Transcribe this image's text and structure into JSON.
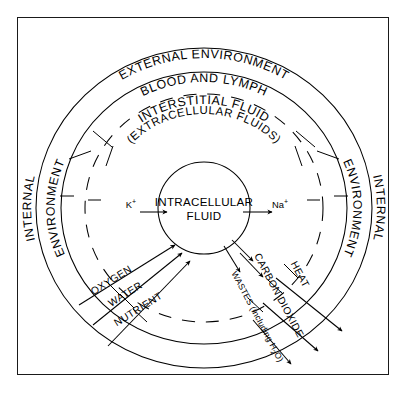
{
  "figure": {
    "type": "concentric-compartment-diagram",
    "background_color": "#ffffff",
    "line_color": "#000000",
    "frame": {
      "present": true,
      "style": "thin rectangular border"
    }
  },
  "rings": [
    {
      "id": "external-environment",
      "label": "EXTERNAL ENVIRONMENT",
      "position": "outermost ring, text curved along top",
      "stroke": "solid"
    },
    {
      "id": "blood-and-lymph",
      "label": "BLOOD AND LYMPH",
      "position": "second ring, text curved along top",
      "stroke": "solid"
    },
    {
      "id": "interstitial-fluid",
      "label": "INTERSTITIAL FLUID",
      "sublabel": "(EXTRACELLULAR FLUIDS)",
      "position": "third ring, text curved along top",
      "stroke": "dashed"
    },
    {
      "id": "intracellular-fluid",
      "label_line1": "INTRACELLULAR",
      "label_line2": "FLUID",
      "position": "innermost circle, centered text",
      "stroke": "solid"
    }
  ],
  "side_labels": {
    "left_outer": "INTERNAL",
    "left_inner": "ENVIRONMENT",
    "right_inner": "ENVIRONMENT",
    "right_outer": "INTERNAL"
  },
  "ions": [
    {
      "id": "potassium",
      "symbol": "K",
      "charge": "+",
      "direction": "into cell",
      "side": "left"
    },
    {
      "id": "sodium",
      "symbol": "Na",
      "charge": "+",
      "direction": "out of cell",
      "side": "right"
    }
  ],
  "inflows": [
    {
      "id": "oxygen",
      "label": "OXYGEN",
      "direction": "inward"
    },
    {
      "id": "water",
      "label": "WATER",
      "direction": "inward"
    },
    {
      "id": "nutrient",
      "label": "NUTRIENT",
      "direction": "inward"
    }
  ],
  "outflows": [
    {
      "id": "heat",
      "label": "HEAT",
      "direction": "outward"
    },
    {
      "id": "carbon-dioxide",
      "label": "CARBON DIOXIDE",
      "direction": "outward"
    },
    {
      "id": "wastes",
      "label_main": "WASTES (including H",
      "label_sub": "2",
      "label_tail": "O)",
      "label_full": "WASTES (including H2O)",
      "direction": "outward"
    }
  ]
}
